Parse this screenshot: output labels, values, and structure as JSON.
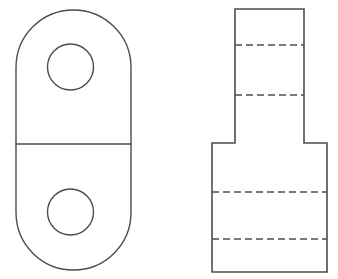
{
  "drawing": {
    "title": "Orthographic Multiview Engineering Drawing",
    "background_color": "#ffffff",
    "line_color": "#4d4d4d",
    "canvas": {
      "width": 338,
      "height": 279
    },
    "views": [
      {
        "id": "top-view",
        "name": "Top View",
        "description": "Obround (slot-shaped) plate outline with two through holes and a horizontal parting line",
        "outline": {
          "shape": "obround",
          "left": 16,
          "right": 131,
          "top": 10,
          "bottom": 270,
          "corner_radius": 57.5
        },
        "parting_line": {
          "y": 144,
          "x1": 16,
          "x2": 131
        },
        "holes": [
          {
            "name": "upper-hole",
            "cx": 70.5,
            "cy": 67,
            "r": 23
          },
          {
            "name": "lower-hole",
            "cx": 70.5,
            "cy": 212,
            "r": 23
          }
        ]
      },
      {
        "id": "front-view",
        "name": "Front View",
        "description": "Stepped T-shaped profile: narrow upper boss on a wide lower base, with four hidden lines",
        "profile": {
          "narrow_left": 235,
          "narrow_right": 304,
          "narrow_top": 9,
          "shoulder_y": 143,
          "wide_left": 212,
          "wide_right": 327,
          "bottom_y": 272
        },
        "hidden_lines": [
          {
            "name": "hidden-line-1",
            "y": 45,
            "x1": 235,
            "x2": 304
          },
          {
            "name": "hidden-line-2",
            "y": 95,
            "x1": 235,
            "x2": 304
          },
          {
            "name": "hidden-line-3",
            "y": 192,
            "x1": 212,
            "x2": 327
          },
          {
            "name": "hidden-line-4",
            "y": 239,
            "x1": 212,
            "x2": 327
          }
        ],
        "hidden_dash_pattern": "7 4"
      }
    ]
  }
}
